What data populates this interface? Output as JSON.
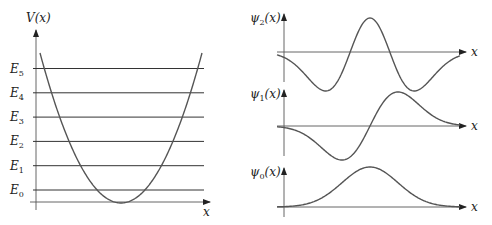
{
  "potential_panel": {
    "y_label": "V(x)",
    "x_label": "x",
    "energy_levels": [
      {
        "name": "E",
        "sub": "0",
        "n": 0
      },
      {
        "name": "E",
        "sub": "1",
        "n": 1
      },
      {
        "name": "E",
        "sub": "2",
        "n": 2
      },
      {
        "name": "E",
        "sub": "3",
        "n": 3
      },
      {
        "name": "E",
        "sub": "4",
        "n": 4
      },
      {
        "name": "E",
        "sub": "5",
        "n": 5
      }
    ],
    "curve": "parabola"
  },
  "wavefunction_panels": [
    {
      "name": "ψ",
      "sub": "2",
      "arg": "(x)",
      "x_label": "x",
      "n": 2
    },
    {
      "name": "ψ",
      "sub": "1",
      "arg": "(x)",
      "x_label": "x",
      "n": 1
    },
    {
      "name": "ψ",
      "sub": "0",
      "arg": "(x)",
      "x_label": "x",
      "n": 0
    }
  ]
}
